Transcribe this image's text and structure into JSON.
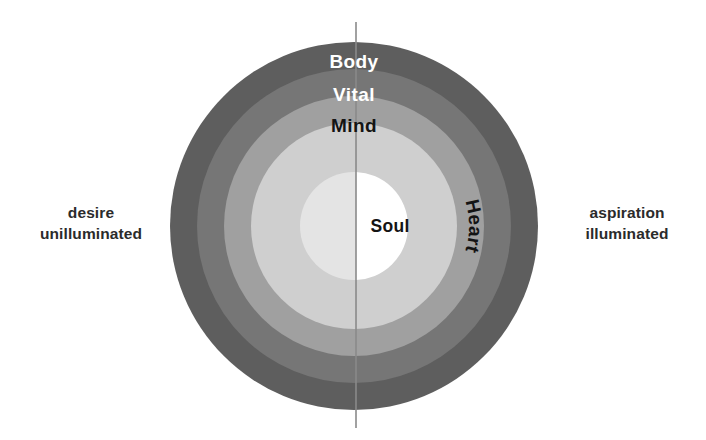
{
  "diagram": {
    "center": {
      "x": 354,
      "y": 226
    },
    "divider": {
      "name": "vertical-axis-line",
      "x": 356,
      "y_top": 22,
      "y_bottom": 428,
      "color": "#8a8a8a",
      "width": 1.6
    },
    "rings": [
      {
        "label": "Body",
        "radius": 184,
        "color": "#5e5e5e",
        "text_color": "#ffffff",
        "label_y": 68
      },
      {
        "label": "Vital",
        "radius": 157,
        "color": "#767676",
        "text_color": "#ffffff",
        "label_y": 101
      },
      {
        "label": "Mind",
        "radius": 130,
        "color": "#a0a0a0",
        "text_color": "#141414",
        "label_y": 132
      },
      {
        "label": "Heart",
        "radius": 103,
        "color": "#cfcfcf",
        "text_color": "#141414",
        "label_y": 226
      },
      {
        "label": "Soul",
        "radius": 54,
        "color": "#e4e4e4",
        "text_color": "#141414",
        "label_y": 226
      }
    ],
    "core": {
      "label": "Soul",
      "left_half_color": "#e4e4e4",
      "right_half_color": "#ffffff",
      "radius": 54
    },
    "heart_label": {
      "text": "Heart",
      "rotation_deg": 90,
      "x": 424,
      "y": 226
    }
  },
  "labels": {
    "left": {
      "name": "left-side-label",
      "line1": "desire",
      "line2": "unilluminated"
    },
    "right": {
      "name": "right-side-label",
      "line1": "aspiration",
      "line2": "illuminated"
    }
  },
  "colors": {
    "background": "#ffffff",
    "text": "#2b2b2b",
    "ring_outer": "#5e5e5e",
    "ring_vital": "#767676",
    "ring_mind": "#a0a0a0",
    "ring_heart": "#cfcfcf",
    "ring_soul": "#e4e4e4",
    "core_white": "#ffffff",
    "divider": "#8a8a8a"
  }
}
